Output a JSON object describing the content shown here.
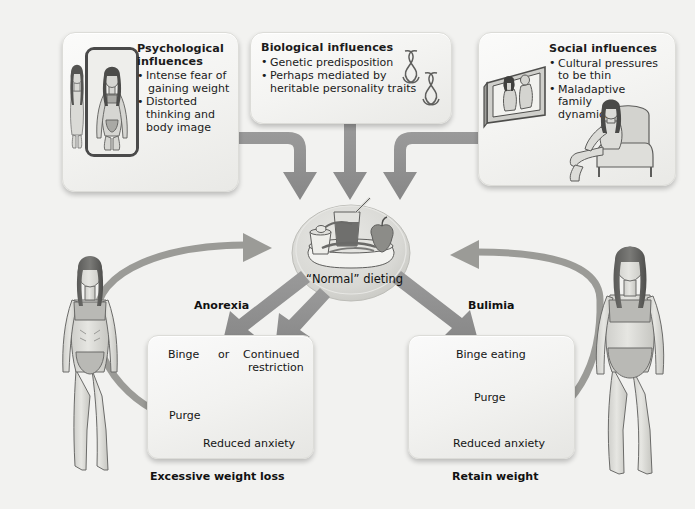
{
  "figure": {
    "title_caption": "",
    "background_color": "#f2f2f0",
    "arrow_color": "#8e8e8e"
  },
  "top_boxes": [
    {
      "id": "psychological",
      "title_line1": "Psychological",
      "title_line2": "influences",
      "bullets": [
        [
          "Intense fear of",
          "gaining weight"
        ],
        [
          "Distorted",
          "thinking and",
          "body image"
        ]
      ],
      "illustration": "mirror-with-distorted-reflection"
    },
    {
      "id": "biological",
      "title_line1": "Biological influences",
      "title_line2": "",
      "bullets": [
        [
          "Genetic predisposition"
        ],
        [
          "Perhaps mediated by",
          "heritable personality traits"
        ]
      ],
      "illustration": "chromosomes"
    },
    {
      "id": "social",
      "title_line1": "Social influences",
      "title_line2": "",
      "bullets": [
        [
          "Cultural pressures",
          "to be thin"
        ],
        [
          "Maladaptive",
          "family",
          "dynamics"
        ]
      ],
      "illustration": "television-and-seated-woman"
    }
  ],
  "center": {
    "label": "“Normal” dieting",
    "illustration": "diet-meal-tray"
  },
  "branches": {
    "left": {
      "section_label": "Anorexia",
      "steps": {
        "binge": "Binge",
        "or": "or",
        "continued": "Continued",
        "restriction": "restriction",
        "purge": "Purge",
        "reduced_anxiety": "Reduced anxiety"
      },
      "outcome_caption": "Excessive weight loss",
      "figure_alt": "emaciated-woman"
    },
    "right": {
      "section_label": "Bulimia",
      "steps": {
        "binge_eating": "Binge eating",
        "purge": "Purge",
        "reduced_anxiety": "Reduced anxiety"
      },
      "outcome_caption": "Retain weight",
      "figure_alt": "normal-weight-woman"
    }
  }
}
